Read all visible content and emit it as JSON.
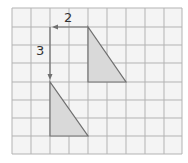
{
  "grid": {
    "columns": 9,
    "rows": 8,
    "line_color": "#b3b3b3",
    "background": "#f4f4f4"
  },
  "shapes": {
    "original_triangle": {
      "vertices_grid": [
        [
          4,
          1
        ],
        [
          4,
          4
        ],
        [
          6,
          4
        ]
      ],
      "fill": "#d9d9d9",
      "stroke": "#707070"
    },
    "translated_triangle": {
      "vertices_grid": [
        [
          2,
          4
        ],
        [
          2,
          7
        ],
        [
          4,
          7
        ]
      ],
      "fill": "#d9d9d9",
      "stroke": "#707070"
    }
  },
  "translation": {
    "horizontal_label": "2",
    "vertical_label": "3",
    "arrow_color": "#707070"
  }
}
